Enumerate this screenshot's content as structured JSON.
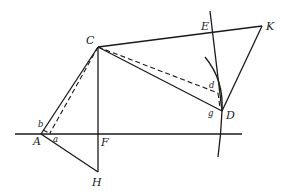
{
  "diagram": {
    "type": "geometric construction",
    "points": [
      {
        "id": "A",
        "label": "A"
      },
      {
        "id": "C",
        "label": "C"
      },
      {
        "id": "D",
        "label": "D"
      },
      {
        "id": "E",
        "label": "E"
      },
      {
        "id": "F",
        "label": "F"
      },
      {
        "id": "H",
        "label": "H"
      },
      {
        "id": "K",
        "label": "K"
      }
    ],
    "small_labels": {
      "a": "a",
      "b": "b",
      "d": "d",
      "g": "g"
    },
    "segments": [
      "AC",
      "CF-H",
      "AH",
      "CK",
      "KD",
      "CD",
      "E-D line",
      "horizontal line through A and F"
    ],
    "dashed": [
      "C to a",
      "C to d"
    ],
    "arc": "arc through D"
  }
}
